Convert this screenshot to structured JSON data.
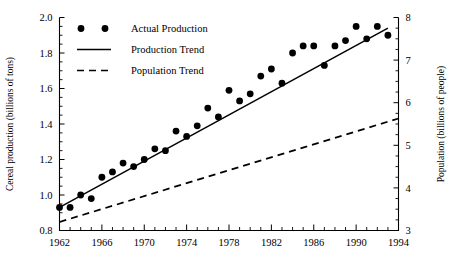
{
  "chart_data": {
    "type": "scatter",
    "title": "",
    "xlabel": "",
    "ylabel": "Cereal production (billions of tons)",
    "y2label": "Population (billions of people)",
    "xlim": [
      1962,
      1994
    ],
    "ylim": [
      0.8,
      2.0
    ],
    "y2lim": [
      3,
      8
    ],
    "grid": false,
    "legend_position": "top-left",
    "xticks": [
      1962,
      1966,
      1970,
      1974,
      1978,
      1982,
      1986,
      1990,
      1994
    ],
    "xticklabels": [
      "1962",
      "1966",
      "1970",
      "1974",
      "1978",
      "1982",
      "1986",
      "1990",
      "1994"
    ],
    "x_minor_tick_interval": 1,
    "yticks": [
      0.8,
      1.0,
      1.2,
      1.4,
      1.6,
      1.8,
      2.0
    ],
    "yticklabels": [
      "0.8",
      "1.0",
      "1.2",
      "1.4",
      "1.6",
      "1.8",
      "2.0"
    ],
    "y_minor_tick_interval": 0.05,
    "y2ticks": [
      3,
      4,
      5,
      6,
      7,
      8
    ],
    "y2ticklabels": [
      "3",
      "4",
      "5",
      "6",
      "7",
      "8"
    ],
    "y2_minor_tick_interval": 0.25,
    "series": [
      {
        "name": "Actual Production",
        "type": "scatter",
        "marker": "circle",
        "color": "#000000",
        "axis": "left",
        "x": [
          1962,
          1963,
          1964,
          1965,
          1966,
          1967,
          1968,
          1969,
          1970,
          1971,
          1972,
          1973,
          1974,
          1975,
          1976,
          1977,
          1978,
          1979,
          1980,
          1981,
          1982,
          1983,
          1984,
          1985,
          1986,
          1987,
          1988,
          1989,
          1990,
          1991,
          1992,
          1993
        ],
        "y": [
          0.93,
          0.93,
          1.0,
          0.98,
          1.1,
          1.13,
          1.18,
          1.16,
          1.2,
          1.26,
          1.25,
          1.36,
          1.33,
          1.39,
          1.49,
          1.44,
          1.59,
          1.53,
          1.57,
          1.67,
          1.71,
          1.63,
          1.8,
          1.84,
          1.84,
          1.73,
          1.84,
          1.87,
          1.95,
          1.88,
          1.95,
          1.9
        ]
      },
      {
        "name": "Production Trend",
        "type": "line",
        "style": "solid",
        "color": "#000000",
        "axis": "left",
        "x": [
          1962,
          1993
        ],
        "y": [
          0.93,
          1.94
        ]
      },
      {
        "name": "Population Trend",
        "type": "line",
        "style": "dashed",
        "color": "#000000",
        "axis": "right",
        "x": [
          1962,
          1994
        ],
        "y": [
          3.2,
          5.63
        ]
      }
    ]
  },
  "legend": {
    "items": [
      {
        "label": "Actual Production",
        "marker": "dots"
      },
      {
        "label": "Production Trend",
        "marker": "solid-line"
      },
      {
        "label": "Population Trend",
        "marker": "dashed-line"
      }
    ]
  }
}
